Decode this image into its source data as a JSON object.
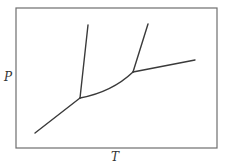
{
  "diagram": {
    "type": "phase-diagram",
    "xlabel": "T",
    "ylabel": "P",
    "line_color": "#3a3a3a",
    "frame_color": "#6e6e6e"
  }
}
